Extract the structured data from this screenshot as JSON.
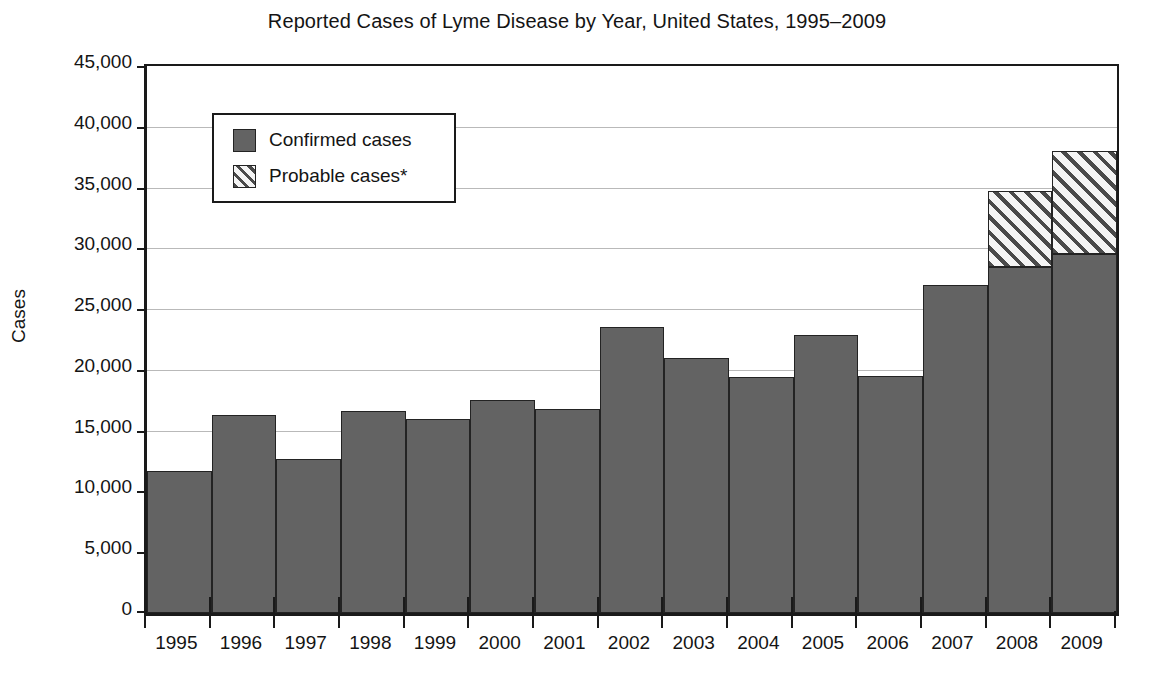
{
  "chart_data": {
    "type": "bar",
    "subtype": "stacked",
    "title": "Reported Cases of Lyme Disease by Year, United States, 1995–2009",
    "xlabel": "",
    "ylabel": "Cases",
    "ylim": [
      0,
      45000
    ],
    "ytick_values": [
      0,
      5000,
      10000,
      15000,
      20000,
      25000,
      30000,
      35000,
      40000,
      45000
    ],
    "ytick_labels": [
      "0",
      "5,000",
      "10,000",
      "15,000",
      "20,000",
      "25,000",
      "30,000",
      "35,000",
      "40,000",
      "45,000"
    ],
    "grid": true,
    "grid_axis": "y",
    "legend_position": "upper left",
    "categories": [
      "1995",
      "1996",
      "1997",
      "1998",
      "1999",
      "2000",
      "2001",
      "2002",
      "2003",
      "2004",
      "2005",
      "2006",
      "2007",
      "2008",
      "2009"
    ],
    "series": [
      {
        "name": "Confirmed cases",
        "style": "solid-gray",
        "color": "#636363",
        "values": [
          11700,
          16300,
          12700,
          16600,
          16000,
          17500,
          16800,
          23500,
          21000,
          19400,
          22900,
          19500,
          27000,
          28500,
          29500
        ]
      },
      {
        "name": "Probable cases*",
        "style": "diagonal-hatch",
        "color": "#f2f2f2",
        "values": [
          0,
          0,
          0,
          0,
          0,
          0,
          0,
          0,
          0,
          0,
          0,
          0,
          0,
          6200,
          8500
        ]
      }
    ],
    "totals": [
      11700,
      16300,
      12700,
      16600,
      16000,
      17500,
      16800,
      23500,
      21000,
      19400,
      22900,
      19500,
      27000,
      34700,
      38000
    ],
    "legend": [
      {
        "label": "Confirmed cases",
        "swatch": "solid-gray"
      },
      {
        "label": "Probable cases*",
        "swatch": "diagonal-hatch"
      }
    ],
    "colors": {
      "confirmed": "#636363",
      "probable_fill": "#f2f2f2",
      "probable_hatch": "#4a4a4a",
      "axis": "#1a1a1a",
      "grid": "#b9b9b9",
      "background": "#ffffff"
    }
  }
}
